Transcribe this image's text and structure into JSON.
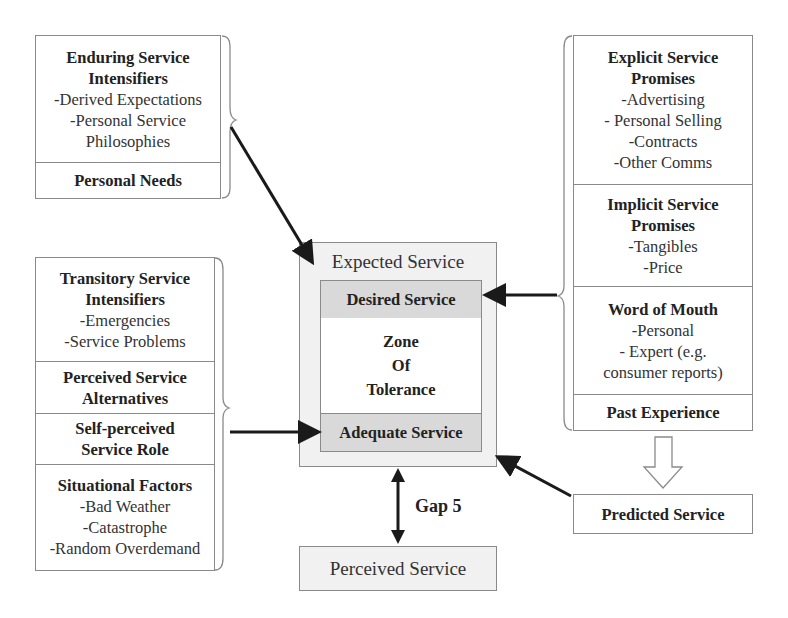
{
  "diagram": {
    "left_top_group": {
      "sections": [
        {
          "title": "Enduring Service Intensifiers",
          "title_lines": [
            "Enduring Service",
            "Intensifiers"
          ],
          "items": [
            "-Derived Expectations",
            "-Personal Service",
            "Philosophies"
          ]
        },
        {
          "title": "Personal Needs",
          "title_lines": [
            "Personal Needs"
          ],
          "items": []
        }
      ]
    },
    "left_bottom_group": {
      "sections": [
        {
          "title": "Transitory Service Intensifiers",
          "title_lines": [
            "Transitory Service",
            "Intensifiers"
          ],
          "items": [
            "-Emergencies",
            "-Service Problems"
          ]
        },
        {
          "title": "Perceived Service Alternatives",
          "title_lines": [
            "Perceived Service",
            "Alternatives"
          ],
          "items": []
        },
        {
          "title": "Self-perceived Service Role",
          "title_lines": [
            "Self-perceived",
            "Service Role"
          ],
          "items": []
        },
        {
          "title": "Situational Factors",
          "title_lines": [
            "Situational Factors"
          ],
          "items": [
            "-Bad Weather",
            "-Catastrophe",
            "-Random Overdemand"
          ]
        }
      ]
    },
    "right_group": {
      "sections": [
        {
          "title": "Explicit Service Promises",
          "title_lines": [
            "Explicit Service",
            "Promises"
          ],
          "items": [
            "-Advertising",
            "- Personal Selling",
            "-Contracts",
            "-Other Comms"
          ]
        },
        {
          "title": "Implicit Service Promises",
          "title_lines": [
            "Implicit Service",
            "Promises"
          ],
          "items": [
            "-Tangibles",
            "-Price"
          ]
        },
        {
          "title": "Word of Mouth",
          "title_lines": [
            "Word of Mouth"
          ],
          "items": [
            "-Personal",
            "- Expert (e.g.",
            "consumer reports)"
          ]
        },
        {
          "title": "Past Experience",
          "title_lines": [
            "Past Experience"
          ],
          "items": []
        }
      ]
    },
    "expected_service": {
      "label": "Expected Service",
      "desired": "Desired Service",
      "zone_lines": [
        "Zone",
        "Of",
        "Tolerance"
      ],
      "adequate": "Adequate Service"
    },
    "predicted_service": {
      "label": "Predicted Service"
    },
    "perceived_service": {
      "label": "Perceived Service"
    },
    "gap": {
      "label": "Gap 5"
    },
    "colors": {
      "border": "#8a8a8a",
      "shaded": "#d9d9d9",
      "expected_bg": "#f1f1f1",
      "arrow": "#1a1a1a"
    }
  }
}
